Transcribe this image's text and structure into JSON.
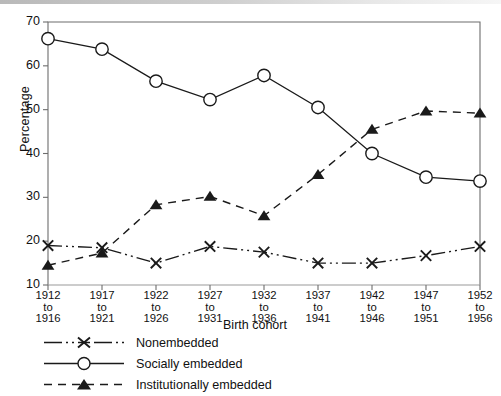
{
  "chart_data": {
    "type": "line",
    "title": "",
    "xlabel": "Birth cohort",
    "ylabel": "Percentage",
    "ylim": [
      10,
      70
    ],
    "yticks": [
      10,
      20,
      30,
      40,
      50,
      60,
      70
    ],
    "grid": false,
    "legend_position": "below",
    "categories": [
      "1912\nto\n1916",
      "1917\nto\n1921",
      "1922\nto\n1926",
      "1927\nto\n1931",
      "1932\nto\n1936",
      "1937\nto\n1941",
      "1942\nto\n1946",
      "1947\nto\n1951",
      "1952\nto\n1956"
    ],
    "categories_lines": [
      [
        "1912",
        "to",
        "1916"
      ],
      [
        "1917",
        "to",
        "1921"
      ],
      [
        "1922",
        "to",
        "1926"
      ],
      [
        "1927",
        "to",
        "1931"
      ],
      [
        "1932",
        "to",
        "1936"
      ],
      [
        "1937",
        "to",
        "1941"
      ],
      [
        "1942",
        "to",
        "1946"
      ],
      [
        "1947",
        "to",
        "1951"
      ],
      [
        "1952",
        "to",
        "1956"
      ]
    ],
    "series": [
      {
        "name": "Nonembedded",
        "marker": "x",
        "linestyle": "dash-dot-dot",
        "color": "#1a1a1a",
        "values": [
          19.0,
          18.5,
          15.0,
          18.8,
          17.5,
          15.0,
          15.0,
          16.7,
          18.8
        ]
      },
      {
        "name": "Socially embedded",
        "marker": "circle-open",
        "linestyle": "solid",
        "color": "#1a1a1a",
        "values": [
          66.2,
          63.8,
          56.5,
          52.3,
          57.8,
          50.5,
          40.0,
          34.6,
          33.7
        ]
      },
      {
        "name": "Institutionally embedded",
        "marker": "triangle-filled",
        "linestyle": "dashed",
        "color": "#1a1a1a",
        "values": [
          14.5,
          17.3,
          28.3,
          30.2,
          25.8,
          35.2,
          45.5,
          49.7,
          49.2
        ]
      }
    ]
  },
  "axis": {
    "y_ticks": [
      "70",
      "60",
      "50",
      "40",
      "30",
      "20",
      "10"
    ],
    "y_title": "Percentage",
    "x_title": "Birth cohort"
  },
  "legend": {
    "items": [
      {
        "label": "Nonembedded",
        "marker": "x-marker",
        "style": "dash-dot-dot"
      },
      {
        "label": "Socially embedded",
        "marker": "circle-marker",
        "style": "solid"
      },
      {
        "label": "Institutionally embedded",
        "marker": "triangle-marker",
        "style": "dashed"
      }
    ]
  },
  "colors": {
    "ink": "#1a1a1a",
    "frame": "#6d6d6d",
    "band": "#c2c2c2"
  }
}
